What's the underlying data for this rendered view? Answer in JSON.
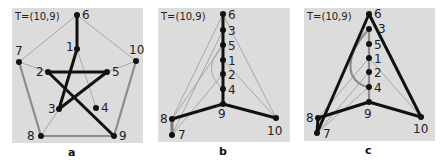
{
  "panels": [
    {
      "id": "a",
      "title": "T=(10,9)",
      "caption": "a",
      "node_labels": {
        "n1": "1",
        "n2": "2",
        "n3": "3",
        "n4": "4",
        "n5": "5",
        "n6": "6",
        "n7": "7",
        "n8": "8",
        "n9": "9",
        "n10": "10"
      }
    },
    {
      "id": "b",
      "title": "T=(10,9)",
      "caption": "b",
      "node_labels": {
        "n1": "1",
        "n2": "2",
        "n3": "3",
        "n4": "4",
        "n5": "5",
        "n6": "6",
        "n7": "7",
        "n8": "8",
        "n9": "9",
        "n10": "10"
      }
    },
    {
      "id": "c",
      "title": "T=(10,9)",
      "caption": "c",
      "node_labels": {
        "n1": "1",
        "n2": "2",
        "n3": "3",
        "n4": "4",
        "n5": "5",
        "n6": "6",
        "n7": "7",
        "n8": "8",
        "n9": "9",
        "n10": "10"
      }
    }
  ],
  "colors": {
    "panel_background": "#dcdcdc",
    "thick_edge": "#111111",
    "gray_edge": "#8c8c8c",
    "thin_edge": "#999999",
    "node": "#111111"
  }
}
